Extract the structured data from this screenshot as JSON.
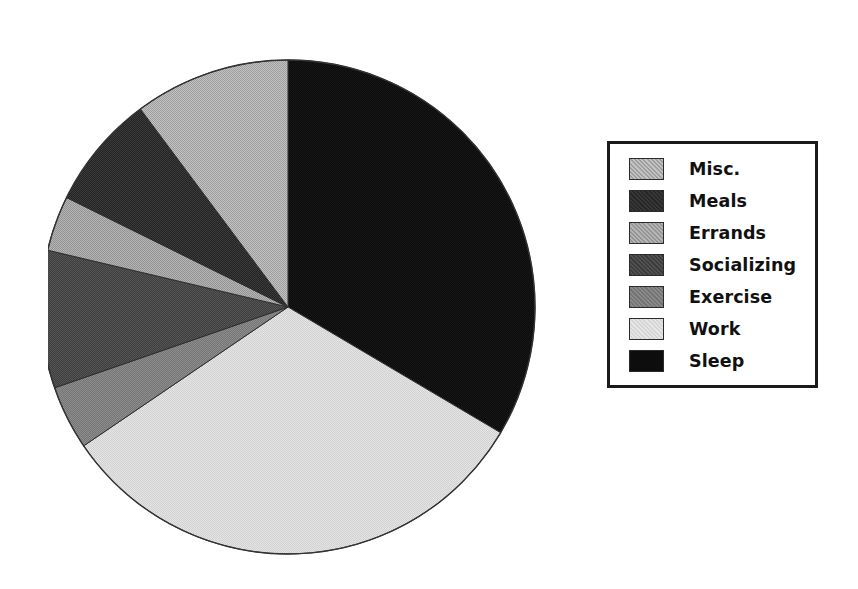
{
  "figure": {
    "background_color": "#ffffff",
    "width": 858,
    "height": 589
  },
  "legend": {
    "border_color": "#1a1a1a",
    "position": "right",
    "items": [
      {
        "label": "Misc.",
        "color": "#b5b5b5"
      },
      {
        "label": "Meals",
        "color": "#2a2a2a"
      },
      {
        "label": "Errands",
        "color": "#a8a8a8"
      },
      {
        "label": "Socializing",
        "color": "#3d3d3d"
      },
      {
        "label": "Exercise",
        "color": "#7a7a7a"
      },
      {
        "label": "Work",
        "color": "#dedede"
      },
      {
        "label": "Sleep",
        "color": "#0d0d0d"
      }
    ]
  },
  "chart_data": {
    "type": "pie",
    "title": "",
    "subtitle": "",
    "xlabel": "",
    "ylabel": "",
    "grid": false,
    "legend_position": "right",
    "start_angle_deg": 0,
    "direction": "clockwise",
    "center": {
      "x": 288,
      "y": 307
    },
    "radius": 247,
    "labels": [
      "Sleep",
      "Work",
      "Exercise",
      "Socializing",
      "Errands",
      "Meals",
      "Misc."
    ],
    "values": [
      33.5,
      32.0,
      4.2,
      9.0,
      3.6,
      7.5,
      10.2
    ],
    "units": "percent of day",
    "slices": [
      {
        "label": "Sleep",
        "value": 33.5,
        "angle_deg": 120.6,
        "start_deg": 0.0,
        "end_deg": 120.6,
        "color": "#0d0d0d"
      },
      {
        "label": "Work",
        "value": 32.0,
        "angle_deg": 115.2,
        "start_deg": 120.6,
        "end_deg": 235.8,
        "color": "#dedede"
      },
      {
        "label": "Exercise",
        "value": 4.2,
        "angle_deg": 15.1,
        "start_deg": 235.8,
        "end_deg": 250.9,
        "color": "#7a7a7a"
      },
      {
        "label": "Socializing",
        "value": 9.0,
        "angle_deg": 32.4,
        "start_deg": 250.9,
        "end_deg": 283.3,
        "color": "#3d3d3d"
      },
      {
        "label": "Errands",
        "value": 3.6,
        "angle_deg": 13.0,
        "start_deg": 283.3,
        "end_deg": 296.3,
        "color": "#a8a8a8"
      },
      {
        "label": "Meals",
        "value": 7.5,
        "angle_deg": 27.0,
        "start_deg": 296.3,
        "end_deg": 323.3,
        "color": "#2a2a2a"
      },
      {
        "label": "Misc.",
        "value": 10.2,
        "angle_deg": 36.7,
        "start_deg": 323.3,
        "end_deg": 360.0,
        "color": "#b5b5b5"
      }
    ]
  }
}
